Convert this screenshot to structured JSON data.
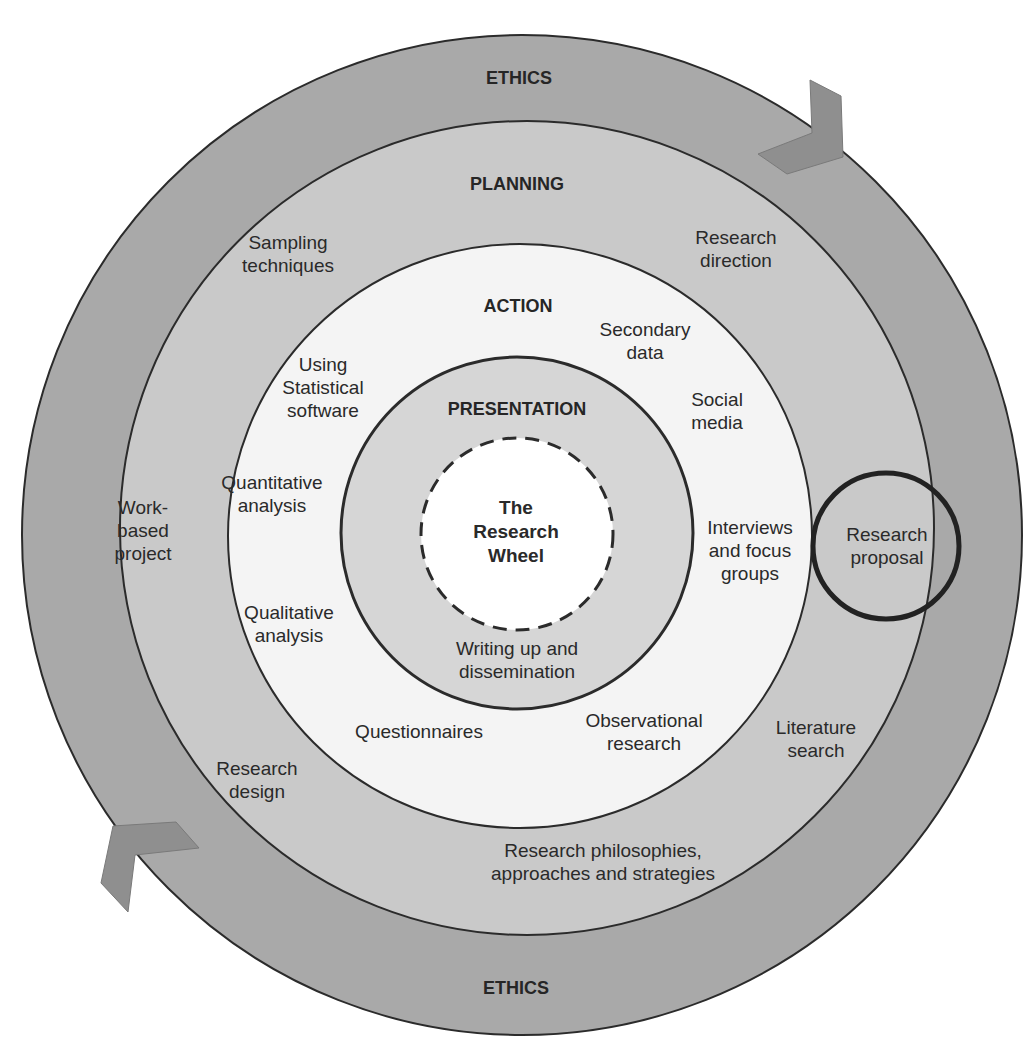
{
  "diagram": {
    "title": "The Research Wheel",
    "colors": {
      "ethics_ring": "#a9a9a9",
      "planning_ring": "#c9c9c9",
      "action_ring": "#f4f4f4",
      "presentation_ring": "#d6d6d6",
      "center": "#ffffff",
      "arrow": "#8f8f8f",
      "outline": "#2b2b2b"
    },
    "rings": {
      "ethics": {
        "top_label": "ETHICS",
        "bottom_label": "ETHICS"
      },
      "planning": {
        "label": "PLANNING",
        "items": [
          "Sampling techniques",
          "Research direction",
          "Work-based project",
          "Research proposal",
          "Literature search",
          "Research design",
          "Research philosophies, approaches and strategies"
        ]
      },
      "action": {
        "label": "ACTION",
        "items": [
          "Secondary data",
          "Using Statistical software",
          "Social media",
          "Quantitative analysis",
          "Interviews and focus groups",
          "Qualitative analysis",
          "Questionnaires",
          "Observational research"
        ]
      },
      "presentation": {
        "label": "PRESENTATION",
        "items": [
          "Writing up and dissemination"
        ]
      }
    },
    "labels": {
      "ethics_top": "ETHICS",
      "ethics_bottom": "ETHICS",
      "planning": "PLANNING",
      "action": "ACTION",
      "presentation": "PRESENTATION",
      "center_1": "The",
      "center_2": "Research",
      "center_3": "Wheel",
      "sampling_1": "Sampling",
      "sampling_2": "techniques",
      "direction_1": "Research",
      "direction_2": "direction",
      "workbased_1": "Work-",
      "workbased_2": "based",
      "workbased_3": "project",
      "proposal_1": "Research",
      "proposal_2": "proposal",
      "literature_1": "Literature",
      "literature_2": "search",
      "design_1": "Research",
      "design_2": "design",
      "philosophies_1": "Research philosophies,",
      "philosophies_2": "approaches and strategies",
      "secondary_1": "Secondary",
      "secondary_2": "data",
      "statistical_1": "Using",
      "statistical_2": "Statistical",
      "statistical_3": "software",
      "social_1": "Social",
      "social_2": "media",
      "quant_1": "Quantitative",
      "quant_2": "analysis",
      "interviews_1": "Interviews",
      "interviews_2": "and focus",
      "interviews_3": "groups",
      "qual_1": "Qualitative",
      "qual_2": "analysis",
      "questionnaires": "Questionnaires",
      "observational_1": "Observational",
      "observational_2": "research",
      "writing_1": "Writing up and",
      "writing_2": "dissemination"
    },
    "highlight": "Research proposal"
  }
}
